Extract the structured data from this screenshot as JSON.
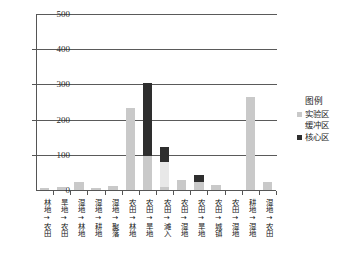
{
  "chart_data": {
    "type": "bar",
    "subtype": "stacked-vertical",
    "title": "",
    "xlabel": "",
    "ylabel": "",
    "ylim": [
      0,
      500
    ],
    "yticks": [
      0,
      100,
      200,
      300,
      400,
      500
    ],
    "ytick_labels": [
      "0",
      "100",
      "200",
      "300",
      "400",
      "500"
    ],
    "grid": true,
    "grid_axis": "y",
    "legend_position": "right",
    "categories": [
      "林地→农田",
      "旱地→农田",
      "湿地→林地",
      "湿地→耕地",
      "湿地→聚落",
      "农田→林地",
      "农田→旱地",
      "农田→滩入",
      "农田→湿地",
      "农田→旱地",
      "农田→城镇",
      "农田→湿地",
      "耕地→湿地",
      "湿地→农田"
    ],
    "series": [
      {
        "name": "实验区",
        "color": "#c9c9c9",
        "values": [
          6,
          9,
          22,
          5,
          10,
          233,
          96,
          8,
          28,
          24,
          13,
          0,
          265,
          22
        ]
      },
      {
        "name": "缓冲区",
        "color": "#e8e8e8",
        "values": [
          0,
          0,
          0,
          0,
          0,
          0,
          0,
          72,
          0,
          0,
          0,
          0,
          0,
          0
        ]
      },
      {
        "name": "核心区",
        "color": "#2e2e2e",
        "values": [
          0,
          0,
          0,
          0,
          0,
          0,
          207,
          42,
          0,
          19,
          0,
          0,
          0,
          0
        ]
      }
    ]
  },
  "legend": {
    "title": "图例",
    "entries": [
      {
        "label": "实验区",
        "color": "#c9c9c9",
        "marker": "square"
      },
      {
        "label": "缓冲区",
        "color": "#e8e8e8",
        "marker": "none"
      },
      {
        "label": "核心区",
        "color": "#2e2e2e",
        "marker": "square"
      }
    ]
  },
  "axes": {
    "y_max_label": "500",
    "y_min_label": "0"
  },
  "colors": {
    "axis": "#555555",
    "grid": "#5a5a5a",
    "background": "#ffffff",
    "text": "#1a1a1a"
  }
}
